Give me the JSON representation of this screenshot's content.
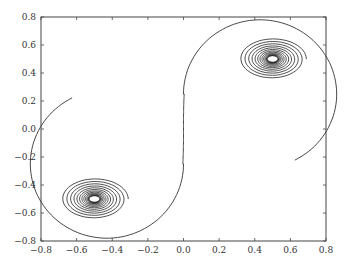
{
  "chart_data": {
    "type": "line",
    "title": "",
    "xlabel": "",
    "ylabel": "",
    "xlim": [
      -0.8,
      0.8
    ],
    "ylim": [
      -0.8,
      0.8
    ],
    "grid": false,
    "legend": null,
    "x_ticks": [
      "−0.8",
      "−0.6",
      "−0.4",
      "−0.2",
      "0.0",
      "0.2",
      "0.4",
      "0.6",
      "0.8"
    ],
    "y_ticks": [
      "0.8",
      "0.6",
      "0.4",
      "0.2",
      "0.0",
      "−0.2",
      "−0.4",
      "−0.6",
      "−0.8"
    ],
    "series": [
      {
        "name": "trajectory",
        "description": "S-shaped curve connecting two spiral attractors",
        "spiral_centers": [
          [
            -0.5,
            -0.5
          ],
          [
            0.5,
            0.5
          ]
        ],
        "path_points": [
          [
            -0.5,
            -0.5
          ],
          [
            -0.28,
            -0.75
          ],
          [
            0.0,
            -0.2
          ],
          [
            0.0,
            0.2
          ],
          [
            0.28,
            0.75
          ],
          [
            0.5,
            0.5
          ]
        ]
      }
    ],
    "color": "#333333"
  }
}
